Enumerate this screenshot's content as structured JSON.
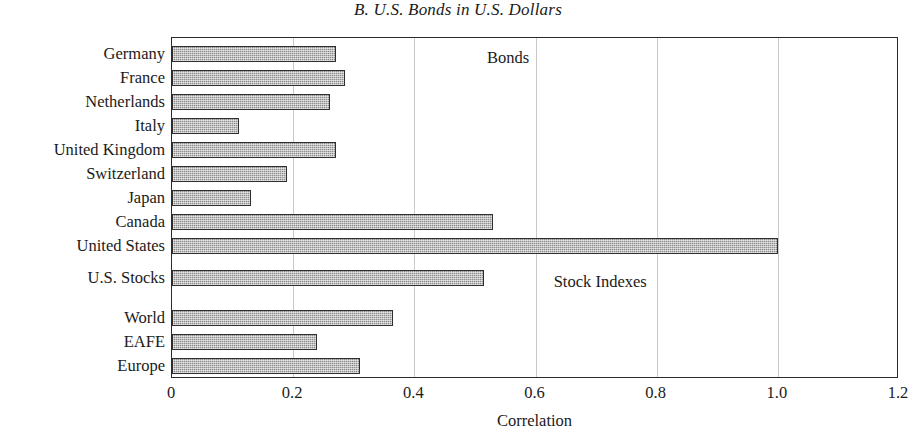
{
  "chart_data": {
    "type": "bar",
    "orientation": "horizontal",
    "title": "B. U.S. Bonds in U.S. Dollars",
    "xlabel": "Correlation",
    "ylabel": "",
    "xlim": [
      0,
      1.2
    ],
    "xticks": [
      "0",
      "0.2",
      "0.4",
      "0.6",
      "0.8",
      "1.0",
      "1.2"
    ],
    "xtick_values": [
      0,
      0.2,
      0.4,
      0.6,
      0.8,
      1.0,
      1.2
    ],
    "grid": "vertical",
    "legend": "none",
    "categories": [
      "Germany",
      "France",
      "Netherlands",
      "Italy",
      "United Kingdom",
      "Switzerland",
      "Japan",
      "Canada",
      "United States",
      "U.S. Stocks",
      "World",
      "EAFE",
      "Europe"
    ],
    "values": [
      0.27,
      0.285,
      0.26,
      0.11,
      0.27,
      0.19,
      0.13,
      0.53,
      1.0,
      0.515,
      0.365,
      0.24,
      0.31
    ],
    "groups": [
      {
        "name": "Bonds",
        "categories": [
          "Germany",
          "France",
          "Netherlands",
          "Italy",
          "United Kingdom",
          "Switzerland",
          "Japan",
          "Canada",
          "United States"
        ]
      },
      {
        "name": "Stock Indexes",
        "categories": [
          "U.S. Stocks",
          "World",
          "EAFE",
          "Europe"
        ]
      }
    ],
    "annotations": [
      {
        "text": "Bonds",
        "x": 0.52,
        "y_category": "Germany"
      },
      {
        "text": "Stock Indexes",
        "x": 0.63,
        "y_category": "U.S. Stocks"
      }
    ],
    "bar_color": "#8c8c8c",
    "bar_edge_color": "#2e2e2e",
    "grid_color": "#c9c9c9",
    "axis_color": "#2b2b2b"
  },
  "bars": [
    {
      "label": "Germany",
      "value": 0.27,
      "top": 8
    },
    {
      "label": "France",
      "value": 0.285,
      "top": 32
    },
    {
      "label": "Netherlands",
      "value": 0.26,
      "top": 56
    },
    {
      "label": "Italy",
      "value": 0.11,
      "top": 80
    },
    {
      "label": "United Kingdom",
      "value": 0.27,
      "top": 104
    },
    {
      "label": "Switzerland",
      "value": 0.19,
      "top": 128
    },
    {
      "label": "Japan",
      "value": 0.13,
      "top": 152
    },
    {
      "label": "Canada",
      "value": 0.53,
      "top": 176
    },
    {
      "label": "United States",
      "value": 1.0,
      "top": 200
    },
    {
      "label": "U.S. Stocks",
      "value": 0.515,
      "top": 232
    },
    {
      "label": "World",
      "value": 0.365,
      "top": 272
    },
    {
      "label": "EAFE",
      "value": 0.24,
      "top": 296
    },
    {
      "label": "Europe",
      "value": 0.31,
      "top": 320
    }
  ],
  "annotations": [
    {
      "text": "Bonds",
      "left": 0.52,
      "top": 10
    },
    {
      "text": "Stock Indexes",
      "left": 0.63,
      "top": 234
    }
  ]
}
